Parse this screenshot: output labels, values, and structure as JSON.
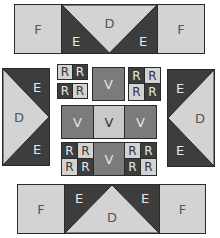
{
  "colors": {
    "light": "#d3d3d3",
    "dark": "#3d3d3d",
    "mid": "#7b7b7b",
    "midlight": "#c9c9c9"
  },
  "top_unit": {
    "left": "F",
    "e_left": "E",
    "center": "D",
    "e_right": "E",
    "right": "F"
  },
  "bottom_unit": {
    "left": "F",
    "e_left": "E",
    "center": "D",
    "e_right": "E",
    "right": "F"
  },
  "left_unit": {
    "e_top": "E",
    "center": "D",
    "e_bottom": "E"
  },
  "right_unit": {
    "e_top": "E",
    "center": "D",
    "e_bottom": "E"
  },
  "center": {
    "top_left_r": [
      "R",
      "R",
      "R",
      "R"
    ],
    "top_v": "V",
    "top_right_r": [
      "R",
      "R",
      "R",
      "R"
    ],
    "middle_v": [
      "V",
      "V",
      "V"
    ],
    "bottom_left_r": [
      "R",
      "R",
      "R",
      "R"
    ],
    "bottom_v": "V",
    "bottom_right_r": [
      "R",
      "R",
      "R",
      "R"
    ]
  }
}
